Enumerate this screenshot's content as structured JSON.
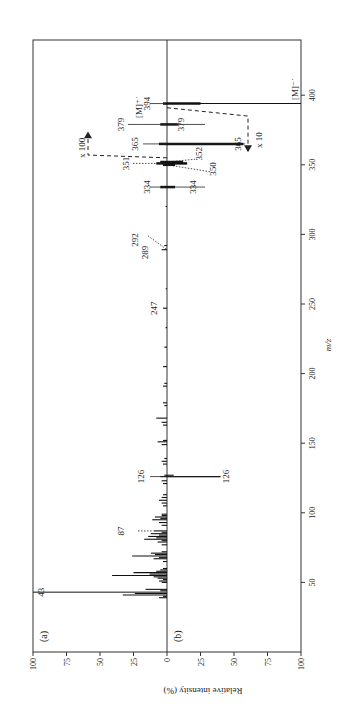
{
  "chart_data": {
    "type": "bar",
    "subtype": "mirrored mass spectrum (rotated 90° counter-clockwise)",
    "xlabel": "m/z",
    "ylabel": "Relative intensity (%)",
    "x_ticks": [
      50,
      100,
      150,
      200,
      250,
      300,
      350,
      400
    ],
    "y_ticks_top": [
      "100",
      "75",
      "50",
      "25",
      "0"
    ],
    "y_ticks_bottom": [
      "25",
      "50",
      "75",
      "100"
    ],
    "xlim": [
      0,
      440
    ],
    "ylim": [
      -100,
      100
    ],
    "grid": false,
    "panels": [
      {
        "label": "(a)",
        "direction": "up",
        "peaks": [
          {
            "mz": 39,
            "intensity": 6
          },
          {
            "mz": 40,
            "intensity": 3
          },
          {
            "mz": 41,
            "intensity": 33
          },
          {
            "mz": 42,
            "intensity": 24
          },
          {
            "mz": 43,
            "intensity": 100
          },
          {
            "mz": 44,
            "intensity": 5
          },
          {
            "mz": 45,
            "intensity": 16
          },
          {
            "mz": 50,
            "intensity": 4
          },
          {
            "mz": 51,
            "intensity": 6
          },
          {
            "mz": 52,
            "intensity": 3
          },
          {
            "mz": 53,
            "intensity": 7
          },
          {
            "mz": 54,
            "intensity": 10
          },
          {
            "mz": 55,
            "intensity": 41
          },
          {
            "mz": 56,
            "intensity": 13
          },
          {
            "mz": 57,
            "intensity": 25
          },
          {
            "mz": 58,
            "intensity": 8
          },
          {
            "mz": 59,
            "intensity": 5
          },
          {
            "mz": 60,
            "intensity": 3
          },
          {
            "mz": 65,
            "intensity": 3
          },
          {
            "mz": 67,
            "intensity": 10
          },
          {
            "mz": 68,
            "intensity": 6
          },
          {
            "mz": 69,
            "intensity": 26
          },
          {
            "mz": 70,
            "intensity": 9
          },
          {
            "mz": 71,
            "intensity": 12
          },
          {
            "mz": 72,
            "intensity": 4
          },
          {
            "mz": 77,
            "intensity": 4
          },
          {
            "mz": 79,
            "intensity": 7
          },
          {
            "mz": 80,
            "intensity": 4
          },
          {
            "mz": 81,
            "intensity": 17
          },
          {
            "mz": 82,
            "intensity": 8
          },
          {
            "mz": 83,
            "intensity": 14
          },
          {
            "mz": 84,
            "intensity": 6
          },
          {
            "mz": 85,
            "intensity": 12
          },
          {
            "mz": 86,
            "intensity": 4
          },
          {
            "mz": 87,
            "intensity": 10
          },
          {
            "mz": 91,
            "intensity": 4
          },
          {
            "mz": 93,
            "intensity": 6
          },
          {
            "mz": 95,
            "intensity": 11
          },
          {
            "mz": 96,
            "intensity": 5
          },
          {
            "mz": 97,
            "intensity": 9
          },
          {
            "mz": 98,
            "intensity": 4
          },
          {
            "mz": 99,
            "intensity": 4
          },
          {
            "mz": 105,
            "intensity": 3
          },
          {
            "mz": 107,
            "intensity": 4
          },
          {
            "mz": 109,
            "intensity": 6
          },
          {
            "mz": 111,
            "intensity": 4
          },
          {
            "mz": 113,
            "intensity": 3
          },
          {
            "mz": 121,
            "intensity": 3
          },
          {
            "mz": 123,
            "intensity": 4
          },
          {
            "mz": 126,
            "intensity": 5
          },
          {
            "mz": 127,
            "intensity": 2
          },
          {
            "mz": 135,
            "intensity": 3
          },
          {
            "mz": 137,
            "intensity": 4
          },
          {
            "mz": 139,
            "intensity": 2
          },
          {
            "mz": 149,
            "intensity": 4
          },
          {
            "mz": 151,
            "intensity": 7
          },
          {
            "mz": 152,
            "intensity": 3
          },
          {
            "mz": 163,
            "intensity": 3
          },
          {
            "mz": 165,
            "intensity": 4
          },
          {
            "mz": 168,
            "intensity": 8
          },
          {
            "mz": 177,
            "intensity": 2
          },
          {
            "mz": 179,
            "intensity": 3
          },
          {
            "mz": 191,
            "intensity": 3
          },
          {
            "mz": 193,
            "intensity": 2
          },
          {
            "mz": 205,
            "intensity": 3
          },
          {
            "mz": 219,
            "intensity": 2
          },
          {
            "mz": 233,
            "intensity": 1
          },
          {
            "mz": 247,
            "intensity": 3
          },
          {
            "mz": 261,
            "intensity": 1
          },
          {
            "mz": 289,
            "intensity": 4
          },
          {
            "mz": 292,
            "intensity": 2
          },
          {
            "mz": 320,
            "intensity": 1
          },
          {
            "mz": 334,
            "intensity": 0.05
          },
          {
            "mz": 351,
            "intensity": 0.08
          },
          {
            "mz": 352,
            "intensity": 0.05
          },
          {
            "mz": 365,
            "intensity": 0.06
          },
          {
            "mz": 379,
            "intensity": 0.05
          },
          {
            "mz": 394,
            "intensity": 0.03
          }
        ],
        "magnified_peaks_x100": [
          {
            "mz": 334,
            "intensity": 5
          },
          {
            "mz": 350,
            "intensity": 3
          },
          {
            "mz": 351,
            "intensity": 8
          },
          {
            "mz": 352,
            "intensity": 5
          },
          {
            "mz": 365,
            "intensity": 6
          },
          {
            "mz": 379,
            "intensity": 5
          },
          {
            "mz": 394,
            "intensity": 3
          }
        ]
      },
      {
        "label": "(b)",
        "direction": "down",
        "peaks": [
          {
            "mz": 126,
            "intensity": 40
          },
          {
            "mz": 127,
            "intensity": 5
          },
          {
            "mz": 334,
            "intensity": 0.6
          },
          {
            "mz": 350,
            "intensity": 0.6
          },
          {
            "mz": 351,
            "intensity": 1.5
          },
          {
            "mz": 352,
            "intensity": 1.2
          },
          {
            "mz": 365,
            "intensity": 5.7
          },
          {
            "mz": 379,
            "intensity": 0.8
          },
          {
            "mz": 394,
            "intensity": 100
          }
        ],
        "magnified_peaks_x10": [
          {
            "mz": 334,
            "intensity": 6
          },
          {
            "mz": 350,
            "intensity": 6
          },
          {
            "mz": 351,
            "intensity": 15
          },
          {
            "mz": 352,
            "intensity": 12
          },
          {
            "mz": 365,
            "intensity": 57
          },
          {
            "mz": 379,
            "intensity": 8
          },
          {
            "mz": 394,
            "intensity": 25
          }
        ]
      }
    ],
    "annotations": [
      {
        "text": "43",
        "panel": "a",
        "mz": 43
      },
      {
        "text": "87",
        "panel": "a",
        "mz": 87,
        "style": "dotted leader"
      },
      {
        "text": "126",
        "panel": "a",
        "mz": 126
      },
      {
        "text": "126",
        "panel": "b",
        "mz": 126
      },
      {
        "text": "247",
        "panel": "a",
        "mz": 247
      },
      {
        "text": "289",
        "panel": "a",
        "mz": 289
      },
      {
        "text": "292",
        "panel": "a",
        "mz": 292,
        "style": "dotted leader"
      },
      {
        "text": "334",
        "panel": "a",
        "mz": 334
      },
      {
        "text": "334",
        "panel": "b",
        "mz": 334
      },
      {
        "text": "351",
        "panel": "a",
        "mz": 351,
        "style": "dotted leader"
      },
      {
        "text": "352",
        "panel": "b",
        "mz": 352,
        "style": "dotted leader"
      },
      {
        "text": "350",
        "panel": "b",
        "mz": 350,
        "style": "dotted leader"
      },
      {
        "text": "365",
        "panel": "a",
        "mz": 365
      },
      {
        "text": "365",
        "panel": "b",
        "mz": 365
      },
      {
        "text": "379",
        "panel": "a",
        "mz": 379
      },
      {
        "text": "379",
        "panel": "b",
        "mz": 379
      },
      {
        "text": "394",
        "panel": "a",
        "mz": 394
      },
      {
        "text": "[M]⁺˙",
        "panel": "a",
        "mz": 394
      },
      {
        "text": "[M]⁻˙",
        "panel": "b",
        "mz": 394
      },
      {
        "text": "x 100",
        "panel": "a",
        "style": "dashed bracket with arrow"
      },
      {
        "text": "x 10",
        "panel": "b",
        "style": "dashed bracket with arrow"
      }
    ]
  },
  "figure": {
    "panel_a_label": "(a)",
    "panel_b_label": "(b)",
    "xlabel": "m/z",
    "ylabel": "Relative intensity (%)",
    "mag_a": "x 100",
    "mag_b": "x 10",
    "mol_ion_pos": "[M]⁺˙",
    "mol_ion_neg": "[M]⁻˙"
  }
}
